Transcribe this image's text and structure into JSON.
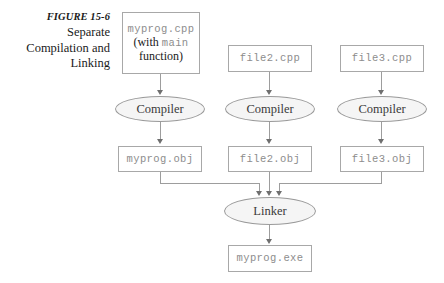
{
  "figure": {
    "label": "FIGURE 15-6",
    "caption_lines": [
      "Separate",
      "Compilation and",
      "Linking"
    ]
  },
  "nodes": {
    "myprog_cpp": {
      "name": "myprog.cpp",
      "note_prefix": "(with",
      "note_mono": "main",
      "note_suffix": "function)"
    },
    "file2_cpp": {
      "name": "file2.cpp"
    },
    "file3_cpp": {
      "name": "file3.cpp"
    },
    "compiler1": {
      "name": "Compiler"
    },
    "compiler2": {
      "name": "Compiler"
    },
    "compiler3": {
      "name": "Compiler"
    },
    "myprog_obj": {
      "name": "myprog.obj"
    },
    "file2_obj": {
      "name": "file2.obj"
    },
    "file3_obj": {
      "name": "file3.obj"
    },
    "linker": {
      "name": "Linker"
    },
    "myprog_exe": {
      "name": "myprog.exe"
    }
  },
  "colors": {
    "background": "#ffffff",
    "box_border": "#a8a8a8",
    "mono_text": "#8d8d8d",
    "serif_text": "#1a1a1a",
    "ellipse_fill": "#f5f5f5",
    "ellipse_border": "#9a9a9a",
    "connector": "#9d9d9d",
    "arrowhead": "#6f6f6f"
  }
}
